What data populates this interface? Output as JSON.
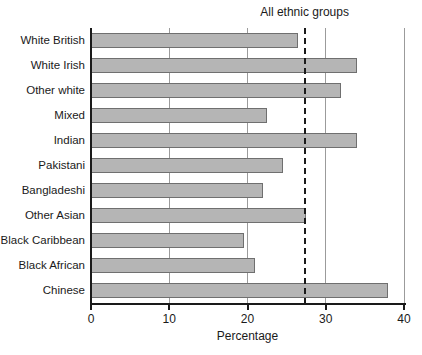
{
  "chart_data": {
    "type": "bar",
    "orientation": "horizontal",
    "title": "",
    "xlabel": "Percentage",
    "xlim": [
      0,
      40
    ],
    "xticks": [
      0,
      10,
      20,
      30,
      40
    ],
    "grid": "vertical-gridlines-at-xticks",
    "categories": [
      "White British",
      "White Irish",
      "Other white",
      "Mixed",
      "Indian",
      "Pakistani",
      "Bangladeshi",
      "Other Asian",
      "Black Caribbean",
      "Black African",
      "Chinese"
    ],
    "values": [
      26.5,
      34,
      32,
      22.5,
      34,
      24.5,
      22,
      27.5,
      19.5,
      21,
      38
    ],
    "reference_line": {
      "label": "All ethnic groups",
      "value": 27.3,
      "style": "dashed"
    },
    "colors": {
      "bar_fill": "#b5b5b5",
      "bar_border": "#6f6f6f",
      "gridline": "#9b9b9b",
      "axis": "#1a1a1a",
      "text": "#1a1a1a",
      "background": "#ffffff"
    }
  }
}
